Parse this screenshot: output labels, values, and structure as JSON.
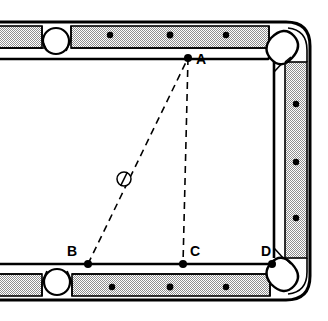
{
  "figure": {
    "kind": "billiard-table-diagram",
    "title": "",
    "background_color": "#ffffff",
    "line_color": "#000000",
    "rail_fill_color": "#c8c8c8",
    "cloth_color": "#ffffff",
    "dashed_color": "#000000"
  },
  "points": [
    {
      "id": "A",
      "label": "A",
      "x": 188,
      "y": 58,
      "label_x": 196,
      "label_y": 62,
      "marker": "dot"
    },
    {
      "id": "B",
      "label": "B",
      "x": 88,
      "y": 264,
      "label_x": 72,
      "label_y": 254,
      "marker": "dot"
    },
    {
      "id": "C",
      "label": "C",
      "x": 183,
      "y": 264,
      "label_x": 189,
      "label_y": 254,
      "marker": "dot"
    },
    {
      "id": "D",
      "label": "D",
      "x": 272,
      "y": 264,
      "label_x": 266,
      "label_y": 254,
      "marker": "dot"
    }
  ],
  "ball": {
    "name": "cue-ball",
    "x": 124,
    "y": 179,
    "r": 7,
    "fill": "#ffffff",
    "stroke": "#000000"
  },
  "segments": [
    {
      "name": "segment-b-to-a",
      "from": "B",
      "to": "A",
      "style": "dashed"
    },
    {
      "name": "segment-a-to-c",
      "from": "A",
      "to": "C",
      "style": "dashed"
    },
    {
      "name": "segment-b-to-d",
      "from": "B",
      "to": "D",
      "style": "dashed"
    }
  ],
  "rail_markers": {
    "top": [
      {
        "x": 110,
        "y": 35
      },
      {
        "x": 170,
        "y": 35
      },
      {
        "x": 226,
        "y": 35
      }
    ],
    "bottom": [
      {
        "x": 112,
        "y": 287
      },
      {
        "x": 170,
        "y": 287
      },
      {
        "x": 226,
        "y": 287
      }
    ],
    "right": [
      {
        "x": 296,
        "y": 104
      },
      {
        "x": 296,
        "y": 162
      },
      {
        "x": 296,
        "y": 218
      }
    ]
  },
  "pockets": [
    {
      "name": "side-pocket-top-left",
      "cx": 56,
      "cy": 38,
      "r": 13,
      "type": "circle"
    },
    {
      "name": "side-pocket-bottom-left",
      "cx": 57,
      "cy": 285,
      "r": 13,
      "type": "circle"
    },
    {
      "name": "corner-pocket-top-right",
      "cx": 284,
      "cy": 43,
      "type": "rounded"
    },
    {
      "name": "corner-pocket-bottom-right",
      "cx": 284,
      "cy": 280,
      "type": "rounded"
    }
  ],
  "marker_color": "#000000"
}
